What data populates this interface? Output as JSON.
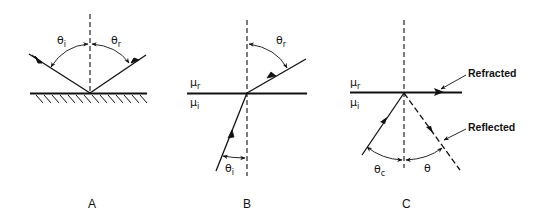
{
  "figure": {
    "panels": [
      {
        "id": "A",
        "caption": "A",
        "description": "Reflection at a plane surface",
        "labels": {
          "theta_i": "θ",
          "theta_i_sub": "i",
          "theta_r": "θ",
          "theta_r_sub": "r"
        }
      },
      {
        "id": "B",
        "caption": "B",
        "description": "Refraction at an interface between two media",
        "labels": {
          "mu_r": "μ",
          "mu_r_sub": "r",
          "mu_i": "μ",
          "mu_i_sub": "i",
          "theta_r": "θ",
          "theta_r_sub": "r",
          "theta_i": "θ",
          "theta_i_sub": "i"
        }
      },
      {
        "id": "C",
        "caption": "C",
        "description": "Critical angle and total internal reflection",
        "labels": {
          "mu_r": "μ",
          "mu_r_sub": "r",
          "mu_i": "μ",
          "mu_i_sub": "i",
          "theta_c": "θ",
          "theta_c_sub": "c",
          "theta": "θ",
          "refracted": "Refracted",
          "reflected": "Reflected"
        }
      }
    ]
  },
  "colors": {
    "ink": "#111111",
    "background": "#ffffff"
  }
}
